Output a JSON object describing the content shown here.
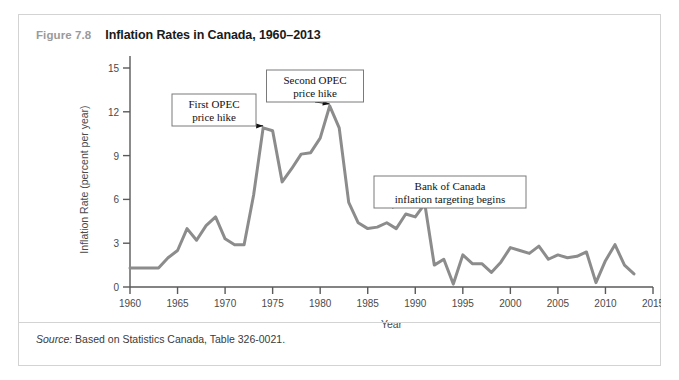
{
  "figure": {
    "number": "Figure 7.8",
    "title": "Inflation Rates in Canada, 1960–2013",
    "source_label": "Source:",
    "source_text": " Based on Statistics Canada, Table 326-0021."
  },
  "colors": {
    "line": "#8c8c8c",
    "frame": "#d3d3d3",
    "axis": "#5a5a5a",
    "title": "#1a1a1a",
    "fig_number": "#9a9a9a",
    "callout_border": "#7a7a7a",
    "callout_text": "#111111",
    "background": "#ffffff"
  },
  "chart_data": {
    "type": "line",
    "title": "Inflation Rates in Canada, 1960–2013",
    "xlabel": "Year",
    "ylabel": "Inflation Rate (percent per year)",
    "xlim": [
      1960,
      2015
    ],
    "ylim": [
      0,
      15
    ],
    "xticks": [
      1960,
      1965,
      1970,
      1975,
      1980,
      1985,
      1990,
      1995,
      2000,
      2005,
      2010,
      2015
    ],
    "yticks": [
      0,
      3,
      6,
      9,
      12,
      15
    ],
    "xtick_labels": [
      "1960",
      "1965",
      "1970",
      "1975",
      "1980",
      "1985",
      "1990",
      "1995",
      "2000",
      "2005",
      "2010",
      "2015"
    ],
    "ytick_labels": [
      "0",
      "3",
      "6",
      "9",
      "12",
      "15"
    ],
    "grid": false,
    "legend": false,
    "series": [
      {
        "name": "Inflation Rate",
        "x": [
          1960,
          1961,
          1962,
          1963,
          1964,
          1965,
          1966,
          1967,
          1968,
          1969,
          1970,
          1971,
          1972,
          1973,
          1974,
          1975,
          1976,
          1977,
          1978,
          1979,
          1980,
          1981,
          1982,
          1983,
          1984,
          1985,
          1986,
          1987,
          1988,
          1989,
          1990,
          1991,
          1992,
          1993,
          1994,
          1995,
          1996,
          1997,
          1998,
          1999,
          2000,
          2001,
          2002,
          2003,
          2004,
          2005,
          2006,
          2007,
          2008,
          2009,
          2010,
          2011,
          2012,
          2013
        ],
        "values": [
          1.3,
          1.3,
          1.3,
          1.3,
          2.0,
          2.5,
          4.0,
          3.2,
          4.2,
          4.8,
          3.3,
          2.9,
          2.9,
          6.3,
          10.9,
          10.7,
          7.2,
          8.1,
          9.1,
          9.2,
          10.2,
          12.4,
          10.9,
          5.8,
          4.4,
          4.0,
          4.1,
          4.4,
          4.0,
          5.0,
          4.8,
          5.7,
          1.5,
          1.9,
          0.2,
          2.2,
          1.6,
          1.6,
          1.0,
          1.7,
          2.7,
          2.5,
          2.3,
          2.8,
          1.9,
          2.2,
          2.0,
          2.1,
          2.4,
          0.3,
          1.8,
          2.9,
          1.5,
          0.9
        ]
      }
    ],
    "annotations": [
      {
        "id": "first-opec",
        "text_lines": [
          "First OPEC",
          "price hike"
        ],
        "points_to_year": 1974,
        "points_to_value": 10.9
      },
      {
        "id": "second-opec",
        "text_lines": [
          "Second OPEC",
          "price hike"
        ],
        "points_to_year": 1981,
        "points_to_value": 12.4
      },
      {
        "id": "boc-inflation-targeting",
        "text_lines": [
          "Bank of Canada",
          "inflation targeting begins"
        ],
        "points_to_year": 1991,
        "points_to_value": 5.7
      }
    ]
  }
}
